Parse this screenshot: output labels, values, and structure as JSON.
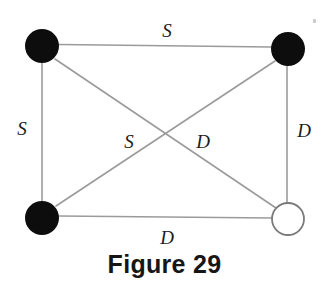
{
  "figure": {
    "caption": "Figure 29",
    "background_color": "#ffffff",
    "edge_color": "#9b9b9b",
    "node_fill_color": "#0d0d0d",
    "node_open_fill_color": "#ffffff",
    "node_open_stroke_color": "#7a7a7a",
    "label_color": "#1c1c1c"
  },
  "graph": {
    "nodes": [
      {
        "id": "top-left",
        "label": "",
        "x": 42,
        "y": 46,
        "radius": 17,
        "style": "filled"
      },
      {
        "id": "top-right",
        "label": "",
        "x": 288,
        "y": 49,
        "radius": 17,
        "style": "filled"
      },
      {
        "id": "bottom-left",
        "label": "",
        "x": 42,
        "y": 218,
        "radius": 17,
        "style": "filled"
      },
      {
        "id": "bottom-right",
        "label": "",
        "x": 288,
        "y": 219,
        "radius": 16,
        "style": "open"
      }
    ],
    "edges": [
      {
        "id": "top-edge",
        "from": "top-left",
        "to": "top-right",
        "label": "S",
        "label_x": 167,
        "label_y": 30
      },
      {
        "id": "left-edge",
        "from": "top-left",
        "to": "bottom-left",
        "label": "S",
        "label_x": 22,
        "label_y": 128
      },
      {
        "id": "right-edge",
        "from": "top-right",
        "to": "bottom-right",
        "label": "D",
        "label_x": 304,
        "label_y": 130
      },
      {
        "id": "bottom-edge",
        "from": "bottom-left",
        "to": "bottom-right",
        "label": "D",
        "label_x": 167,
        "label_y": 237
      },
      {
        "id": "diagonal-tl-br",
        "from": "top-left",
        "to": "bottom-right",
        "label": "D",
        "label_x": 203,
        "label_y": 141
      },
      {
        "id": "diagonal-bl-tr",
        "from": "bottom-left",
        "to": "top-right",
        "label": "S",
        "label_x": 129,
        "label_y": 141
      }
    ]
  }
}
